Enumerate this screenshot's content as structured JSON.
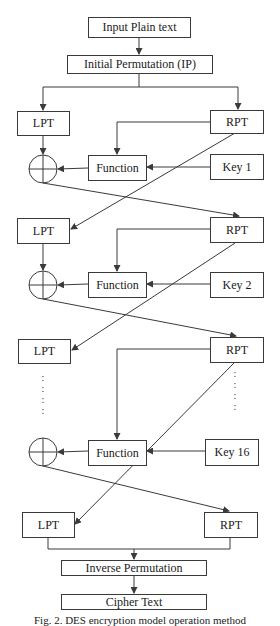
{
  "diagram": {
    "input": "Input Plain text",
    "initial_permutation": "Initial Permutation (IP)",
    "rounds": [
      {
        "left": "LPT",
        "right": "RPT",
        "function": "Function",
        "key": "Key 1"
      },
      {
        "left": "LPT",
        "right": "RPT",
        "function": "Function",
        "key": "Key 2"
      },
      {
        "left": "LPT",
        "right": "RPT",
        "function": "Function",
        "key": "Key 16"
      }
    ],
    "final": {
      "left": "LPT",
      "right": "RPT"
    },
    "inverse_permutation": "Inverse Permutation",
    "output": "Cipher Text",
    "ellipsis": ":\n:\n:\n:",
    "caption": "Fig. 2. DES encryption model operation method"
  },
  "colors": {
    "line": "#3a3a3a",
    "background": "#ffffff"
  }
}
